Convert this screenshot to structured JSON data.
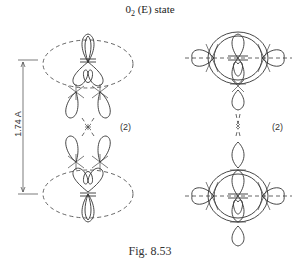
{
  "figure": {
    "title_prefix": "0",
    "title_subscript": "2",
    "title_suffix": " (E) state",
    "caption": "Fig. 8.53",
    "left_panel": {
      "dimension_label": "1.74 A",
      "multiplicity_label": "(2)"
    },
    "right_panel": {
      "multiplicity_label": "(2)"
    }
  }
}
